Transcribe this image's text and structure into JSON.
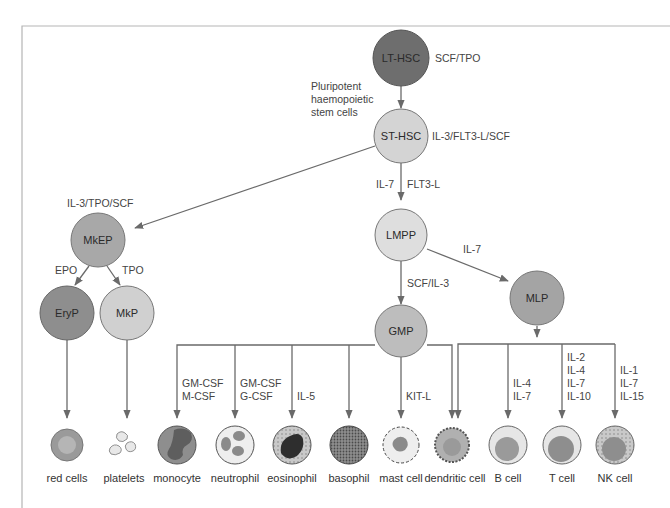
{
  "diagram": {
    "type": "haematopoiesis-lineage-tree",
    "nodes": {
      "lt_hsc": {
        "label": "LT-HSC",
        "factor": "SCF/TPO",
        "color": "#6e6e6e"
      },
      "pluripotent_note": [
        "Pluripotent",
        "haemopoietic",
        "stem cells"
      ],
      "st_hsc": {
        "label": "ST-HSC",
        "factor": "IL-3/FLT3-L/SCF",
        "color": "#d4d4d4"
      },
      "mkep": {
        "label": "MkEP",
        "factor": "IL-3/TPO/SCF",
        "color": "#a8a8a8"
      },
      "eryp": {
        "label": "EryP",
        "factor": "EPO",
        "color": "#8e8e8e"
      },
      "mkp": {
        "label": "MkP",
        "factor": "TPO",
        "color": "#d0d0d0"
      },
      "lmpp": {
        "label": "LMPP",
        "factor_left": "IL-7",
        "factor_right": "FLT3-L",
        "color": "#dedede"
      },
      "mlp": {
        "label": "MLP",
        "factor": "IL-7",
        "color": "#a4a4a4"
      },
      "gmp": {
        "label": "GMP",
        "factor": "SCF/IL-3",
        "color": "#bdbdbd"
      }
    },
    "branch_factors": {
      "monocyte": [
        "GM-CSF",
        "M-CSF"
      ],
      "neutrophil": [
        "GM-CSF",
        "G-CSF"
      ],
      "eosinophil": [
        "IL-5"
      ],
      "mast_cell": [
        "KIT-L"
      ],
      "b_cell": [
        "IL-4",
        "IL-7"
      ],
      "t_cell": [
        "IL-2",
        "IL-4",
        "IL-7",
        "IL-10"
      ],
      "nk_cell": [
        "IL-1",
        "IL-7",
        "IL-15"
      ]
    },
    "cells": [
      {
        "id": "red_cells",
        "label": "red cells"
      },
      {
        "id": "platelets",
        "label": "platelets"
      },
      {
        "id": "monocyte",
        "label": "monocyte"
      },
      {
        "id": "neutrophil",
        "label": "neutrophil"
      },
      {
        "id": "eosinophil",
        "label": "eosinophil"
      },
      {
        "id": "basophil",
        "label": "basophil"
      },
      {
        "id": "mast_cell",
        "label": "mast cell"
      },
      {
        "id": "dendritic_cell",
        "label": "dendritic cell"
      },
      {
        "id": "b_cell",
        "label": "B cell"
      },
      {
        "id": "t_cell",
        "label": "T cell"
      },
      {
        "id": "nk_cell",
        "label": "NK cell"
      }
    ]
  },
  "colors": {
    "line": "#6a6a6a",
    "frame": "#b5b5b5"
  }
}
